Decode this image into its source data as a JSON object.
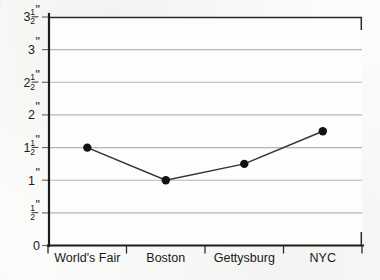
{
  "chart_data": {
    "type": "line",
    "title": "",
    "xlabel": "",
    "ylabel": "",
    "categories": [
      "World's Fair",
      "Boston",
      "Gettysburg",
      "NYC"
    ],
    "values": [
      1.5,
      1.0,
      1.25,
      1.75
    ],
    "value_labels": [
      "1 1/2\"",
      "1\"",
      "1 1/4\"",
      "1 3/4\""
    ],
    "ylim": [
      0,
      3.5
    ],
    "ytick_values": [
      0,
      0.5,
      1,
      1.5,
      2,
      2.5,
      3,
      3.5
    ],
    "ytick_labels": [
      "0",
      "1/2\"",
      "1\"",
      "1 1/2\"",
      "2\"",
      "2 1/2\"",
      "3\"",
      "3 1/2\""
    ],
    "grid": true,
    "grid_axis": "y",
    "legend": false,
    "legend_position": "none",
    "marker": "filled-circle",
    "units": "inches"
  },
  "axes": {
    "y": {
      "ticks": [
        {
          "value": 3.5,
          "whole": "3",
          "numerator": "1",
          "denominator": "2",
          "inch": "\""
        },
        {
          "value": 3,
          "whole": "3",
          "numerator": "",
          "denominator": "",
          "inch": "\""
        },
        {
          "value": 2.5,
          "whole": "2",
          "numerator": "1",
          "denominator": "2",
          "inch": "\""
        },
        {
          "value": 2,
          "whole": "2",
          "numerator": "",
          "denominator": "",
          "inch": "\""
        },
        {
          "value": 1.5,
          "whole": "1",
          "numerator": "1",
          "denominator": "2",
          "inch": "\""
        },
        {
          "value": 1,
          "whole": "1",
          "numerator": "",
          "denominator": "",
          "inch": "\""
        },
        {
          "value": 0.5,
          "whole": "",
          "numerator": "1",
          "denominator": "2",
          "inch": "\""
        },
        {
          "value": 0,
          "whole": "0",
          "numerator": "",
          "denominator": "",
          "inch": ""
        }
      ]
    },
    "x": {
      "labels": [
        "World's Fair",
        "Boston",
        "Gettysburg",
        "NYC"
      ]
    }
  },
  "colors": {
    "background": "#fbfbfa",
    "gridline": "#b4b4b4",
    "axis": "#1c1c1c",
    "frame": "#2a2a2a",
    "series": "#333333",
    "marker": "#111111",
    "text": "#191919"
  }
}
